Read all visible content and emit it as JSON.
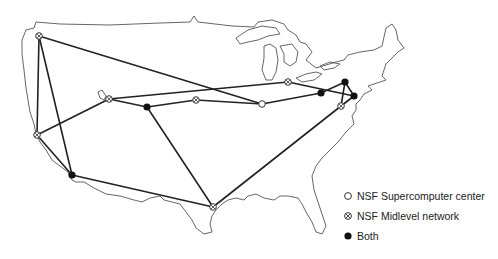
{
  "map": {
    "title": "",
    "region": "Continental United States",
    "node_types": {
      "supercomputer": "open-circle",
      "midlevel": "crossed-circle",
      "both": "filled-circle"
    },
    "nodes": [
      {
        "id": "seattle",
        "x": 39,
        "y": 36,
        "type": "midlevel"
      },
      {
        "id": "palo_alto",
        "x": 37,
        "y": 135,
        "type": "midlevel"
      },
      {
        "id": "san_diego",
        "x": 72,
        "y": 175,
        "type": "both"
      },
      {
        "id": "salt_lake",
        "x": 109,
        "y": 99,
        "type": "midlevel"
      },
      {
        "id": "boulder",
        "x": 147,
        "y": 107,
        "type": "both"
      },
      {
        "id": "lincoln",
        "x": 196,
        "y": 100,
        "type": "midlevel"
      },
      {
        "id": "urbana",
        "x": 262,
        "y": 104,
        "type": "supercomputer"
      },
      {
        "id": "ann_arbor",
        "x": 288,
        "y": 82,
        "type": "midlevel"
      },
      {
        "id": "pittsburgh",
        "x": 321,
        "y": 93,
        "type": "both"
      },
      {
        "id": "ithaca",
        "x": 345,
        "y": 82,
        "type": "both"
      },
      {
        "id": "princeton",
        "x": 354,
        "y": 96,
        "type": "both"
      },
      {
        "id": "college_park",
        "x": 341,
        "y": 106,
        "type": "midlevel"
      },
      {
        "id": "houston",
        "x": 213,
        "y": 207,
        "type": "midlevel"
      }
    ]
  },
  "legend": {
    "items": [
      {
        "symbol": "open-circle",
        "label": "NSF Supercomputer center"
      },
      {
        "symbol": "crossed-circle",
        "label": "NSF Midlevel network"
      },
      {
        "symbol": "filled-circle",
        "label": "Both"
      }
    ]
  }
}
